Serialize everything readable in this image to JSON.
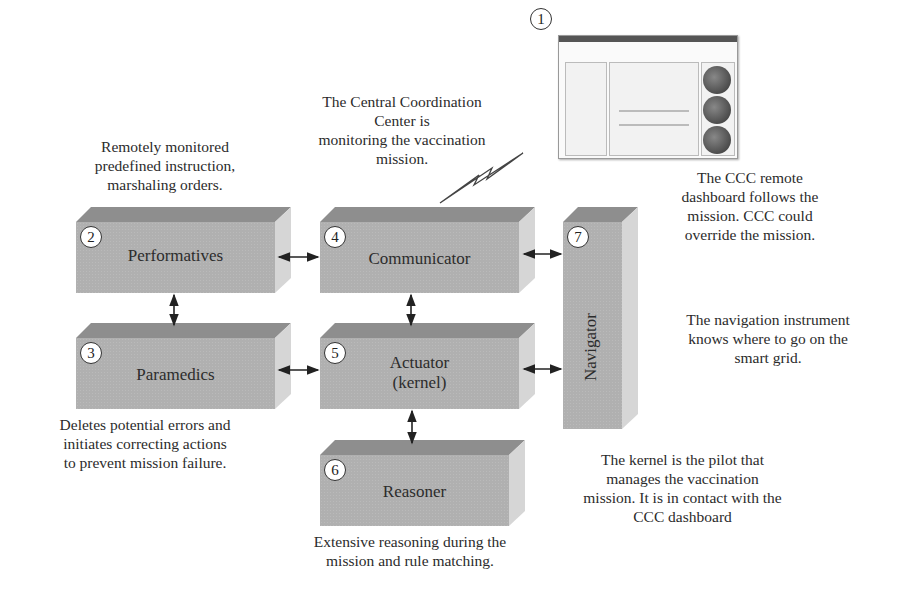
{
  "notes": {
    "remote": "Remotely monitored\npredefined instruction,\nmarshaling orders.",
    "ccc": "The Central Coordination\nCenter is\nmonitoring the vaccination\nmission.",
    "dashboard": "The CCC remote\ndashboard follows the\nmission. CCC could\noverride the mission.",
    "navigation": "The navigation instrument\nknows where to go on the\nsmart grid.",
    "paramedics": "Deletes potential errors and\ninitiates correcting actions\nto prevent mission failure.",
    "kernel": "The kernel is the pilot that\nmanages the vaccination\nmission. It is in contact with the\nCCC dashboard",
    "reasoner": "Extensive reasoning during the\nmission and rule matching."
  },
  "dashboard_thumbnail": {
    "number": "1"
  },
  "boxes": [
    {
      "number": "2",
      "label": "Performatives"
    },
    {
      "number": "3",
      "label": "Paramedics"
    },
    {
      "number": "4",
      "label": "Communicator"
    },
    {
      "number": "5",
      "label": "Actuator",
      "sublabel": "(kernel)"
    },
    {
      "number": "6",
      "label": "Reasoner"
    },
    {
      "number": "7",
      "label": "Navigator"
    }
  ],
  "colors": {
    "box_front": "#b0b0b0",
    "box_top": "#8e8e8e",
    "box_side": "#d6d6d6",
    "text": "#2b2b2b"
  }
}
